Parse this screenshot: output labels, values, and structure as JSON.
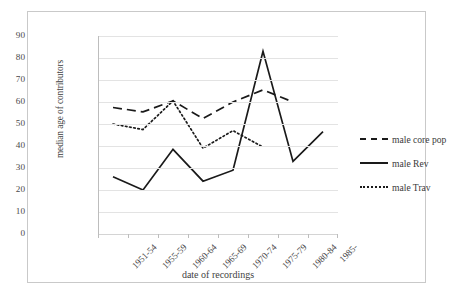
{
  "figure": {
    "caption": ""
  },
  "axes": {
    "y_title": "median age of contributors",
    "x_title": "date of recordings",
    "y_ticks": [
      "0",
      "10",
      "20",
      "30",
      "40",
      "50",
      "60",
      "70",
      "80",
      "90"
    ],
    "x_ticks": [
      "1951-54",
      "1955-59",
      "1960-64",
      "1965-69",
      "1970-74",
      "1975-79",
      "1980-84",
      "1985-"
    ]
  },
  "legend": {
    "items": [
      {
        "label": "male core pop",
        "style": "dashed"
      },
      {
        "label": "male Rev",
        "style": "solid"
      },
      {
        "label": "male Trav",
        "style": "dotted"
      }
    ]
  },
  "colors": {
    "line": "#1a1a1a",
    "grid": "#e3e3e3",
    "frame": "#c9c9c9",
    "text": "#3a3a3a"
  },
  "chart_data": {
    "type": "line",
    "title": "",
    "xlabel": "date of recordings",
    "ylabel": "median age of contributors",
    "ylim": [
      0,
      90
    ],
    "ytick_step": 10,
    "grid": true,
    "legend_position": "right",
    "categories": [
      "1951-54",
      "1955-59",
      "1960-64",
      "1965-69",
      "1970-74",
      "1975-79",
      "1980-84",
      "1985-"
    ],
    "series": [
      {
        "name": "male core pop",
        "style": "dashed",
        "values": [
          57.5,
          55.5,
          60.5,
          52.5,
          60.0,
          65.5,
          60.0,
          null
        ]
      },
      {
        "name": "male Rev",
        "style": "solid",
        "values": [
          26.0,
          20.0,
          38.5,
          24.0,
          29.0,
          83.0,
          33.0,
          46.5
        ]
      },
      {
        "name": "male Trav",
        "style": "dotted",
        "values": [
          50.0,
          47.5,
          60.5,
          39.0,
          47.0,
          39.5,
          null,
          null
        ]
      }
    ]
  }
}
